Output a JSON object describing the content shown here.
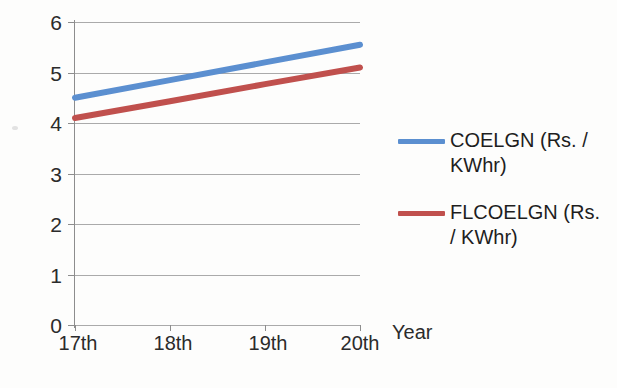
{
  "chart_data": {
    "type": "line",
    "title": "",
    "subtitle": "",
    "xlabel": "Year",
    "ylabel": "",
    "categories": [
      "17th",
      "18th",
      "19th",
      "20th"
    ],
    "ylim": [
      0,
      6
    ],
    "ytick_step": 1,
    "yticks": [
      "0",
      "1",
      "2",
      "3",
      "4",
      "5",
      "6"
    ],
    "grid": true,
    "legend_position": "right",
    "series": [
      {
        "name": "COELGN (Rs. / KWhr)",
        "color": "#5B8FD0",
        "values": [
          4.5,
          4.85,
          5.2,
          5.55
        ]
      },
      {
        "name": "FLCOELGN (Rs. / KWhr)",
        "color": "#C0504D",
        "values": [
          4.1,
          4.43,
          4.77,
          5.1
        ]
      }
    ]
  },
  "axis": {
    "x_title": "Year",
    "x_categories": [
      "17th",
      "18th",
      "19th",
      "20th"
    ],
    "y_ticks": [
      "6",
      "5",
      "4",
      "3",
      "2",
      "1",
      "0"
    ]
  },
  "legend": {
    "entries": [
      {
        "label": "COELGN (Rs. / KWhr)",
        "color": "#5B8FD0"
      },
      {
        "label": "FLCOELGN (Rs. / KWhr)",
        "color": "#C0504D"
      }
    ]
  },
  "colors": {
    "series_blue": "#5B8FD0",
    "series_red": "#C0504D",
    "gridline": "#9B9B9B",
    "axis": "#8D8D8D",
    "text": "#2B2B2B",
    "background": "#FDFDFC"
  }
}
